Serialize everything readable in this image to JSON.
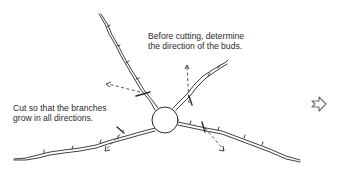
{
  "diagram": {
    "caption_top": {
      "line1": "Before cutting, determine",
      "line2": "the direction of the buds."
    },
    "caption_left": {
      "line1": "Cut so that the branches",
      "line2": "grow in all directions."
    },
    "icons": {
      "next": "next-arrow-icon"
    },
    "colors": {
      "ink": "#2a2a2a",
      "background": "#ffffff"
    }
  }
}
